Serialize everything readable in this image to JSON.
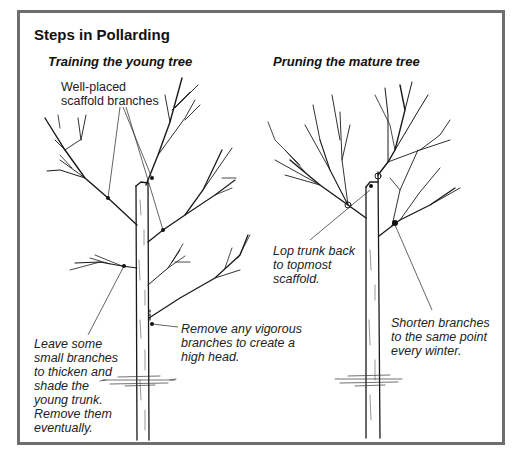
{
  "figure": {
    "title": "Steps in Pollarding",
    "border_color": "#6e6e6e",
    "panels": [
      {
        "id": "young",
        "heading": "Training the young tree",
        "annotations": [
          {
            "id": "scaffold",
            "text": "Well-placed\nscaffold branches",
            "style": "regular"
          },
          {
            "id": "leave",
            "text": "Leave some\nsmall branches\nto thicken and\nshade the\nyoung trunk.\nRemove them\neventually.",
            "style": "italic"
          },
          {
            "id": "remove",
            "text": "Remove any vigorous\nbranches to create a\nhigh head.",
            "style": "italic"
          }
        ]
      },
      {
        "id": "mature",
        "heading": "Pruning the mature tree",
        "annotations": [
          {
            "id": "lop",
            "text": "Lop trunk back\nto topmost\nscaffold.",
            "style": "italic"
          },
          {
            "id": "shorten",
            "text": "Shorten branches\nto the same point\nevery winter.",
            "style": "italic"
          }
        ]
      }
    ],
    "icons": {
      "young_tree": "young-tree-illustration",
      "mature_tree": "mature-tree-illustration"
    }
  }
}
